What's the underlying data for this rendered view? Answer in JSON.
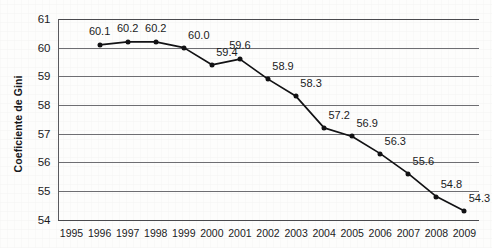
{
  "chart_data": {
    "type": "line",
    "title": "",
    "xlabel": "",
    "ylabel": "Coeficiente de Gini",
    "ylim": [
      54,
      61
    ],
    "yticks": [
      54,
      55,
      56,
      57,
      58,
      59,
      60,
      61
    ],
    "grid": true,
    "legend": "none",
    "marker": "filled-circle",
    "line_color": "#121214",
    "marker_color": "#121214",
    "grid_color": "#6e6e72",
    "axis_tick_labels_x": [
      "1995",
      "1996",
      "1997",
      "1998",
      "1999",
      "2000",
      "2001",
      "2002",
      "2003",
      "2004",
      "2005",
      "2006",
      "2007",
      "2008",
      "2009"
    ],
    "categories": [
      "1996",
      "1997",
      "1998",
      "1999",
      "2000",
      "2001",
      "2002",
      "2003",
      "2004",
      "2005",
      "2006",
      "2007",
      "2008",
      "2009"
    ],
    "values": [
      60.1,
      60.2,
      60.2,
      60.0,
      59.4,
      59.6,
      58.9,
      58.3,
      57.2,
      56.9,
      56.3,
      55.6,
      54.8,
      54.3
    ],
    "data_labels": [
      "60.1",
      "60.2",
      "60.2",
      "60.0",
      "59.4",
      "59.6",
      "58.9",
      "58.3",
      "57.2",
      "56.9",
      "56.3",
      "55.6",
      "54.8",
      "54.3"
    ],
    "series": [
      {
        "name": "Coeficiente de Gini",
        "points": [
          {
            "x": "1996",
            "y": 60.1,
            "label": "60.1",
            "label_pos": "above"
          },
          {
            "x": "1997",
            "y": 60.2,
            "label": "60.2",
            "label_pos": "above"
          },
          {
            "x": "1998",
            "y": 60.2,
            "label": "60.2",
            "label_pos": "above"
          },
          {
            "x": "1999",
            "y": 60.0,
            "label": "60.0",
            "label_pos": "above-right"
          },
          {
            "x": "2000",
            "y": 59.4,
            "label": "59.4",
            "label_pos": "above-right"
          },
          {
            "x": "2001",
            "y": 59.6,
            "label": "59.6",
            "label_pos": "above"
          },
          {
            "x": "2002",
            "y": 58.9,
            "label": "58.9",
            "label_pos": "above-right"
          },
          {
            "x": "2003",
            "y": 58.3,
            "label": "58.3",
            "label_pos": "above-right"
          },
          {
            "x": "2004",
            "y": 57.2,
            "label": "57.2",
            "label_pos": "above-right"
          },
          {
            "x": "2005",
            "y": 56.9,
            "label": "56.9",
            "label_pos": "above-right"
          },
          {
            "x": "2006",
            "y": 56.3,
            "label": "56.3",
            "label_pos": "above-right"
          },
          {
            "x": "2007",
            "y": 55.6,
            "label": "55.6",
            "label_pos": "above-right"
          },
          {
            "x": "2008",
            "y": 54.8,
            "label": "54.8",
            "label_pos": "above-right"
          },
          {
            "x": "2009",
            "y": 54.3,
            "label": "54.3",
            "label_pos": "above-right"
          }
        ]
      }
    ]
  }
}
